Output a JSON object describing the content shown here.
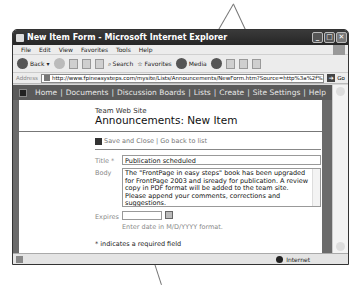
{
  "window": {
    "title": "New Item Form - Microsoft Internet Explorer",
    "controls": {
      "minimize": "_",
      "maximize": "□",
      "close": "✕"
    }
  },
  "menu": [
    "File",
    "Edit",
    "View",
    "Favorites",
    "Tools",
    "Help"
  ],
  "toolbar": {
    "back": "Back",
    "search": "Search",
    "favorites": "Favorites",
    "media": "Media"
  },
  "address": {
    "label": "Address",
    "url": "http://www.fpineasysteps.com/mysite/Lists/Announcements/NewForm.htm?Source=http%3a%2f%2fw",
    "go": "Go"
  },
  "nav": {
    "items": [
      "Home",
      "Documents",
      "Discussion Boards",
      "Lists",
      "Create",
      "Site Settings",
      "Help"
    ],
    "separator": "|"
  },
  "page": {
    "site_name": "Team Web Site",
    "title": "Announcements: New Item",
    "actions": {
      "save": "Save and Close",
      "separator": "|",
      "back": "Go back to list"
    },
    "form": {
      "title_label": "Title *",
      "title_value": "Publication scheduled",
      "body_label": "Body",
      "body_value": "The \"FrontPage in easy steps\" book has been upgraded for FrontPage 2003 and isready for publication. A review copy in PDF format will be added to the team site. Please append your comments, corrections and suggestions.",
      "expires_label": "Expires",
      "expires_value": "",
      "expires_hint": "Enter date in M/D/YYYY format.",
      "required_note": "* indicates a required field"
    }
  },
  "status": {
    "zone": "Internet"
  }
}
